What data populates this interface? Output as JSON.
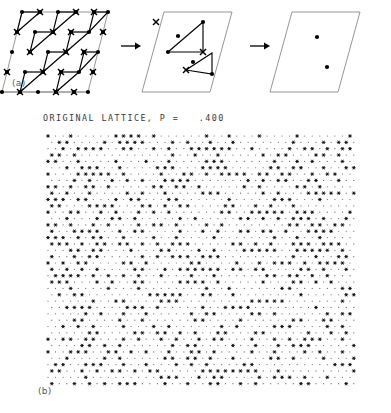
{
  "figure": {
    "labels": {
      "panel_a": "(a)",
      "panel_b": "(b)"
    },
    "panel_b_title": "ORIGINAL LATTICE, P =   .400",
    "colors": {
      "ink": "#000000",
      "cell_outline": "#8a8a8a",
      "grey_bond": "#8e8e8e",
      "background": "#ffffff",
      "label_grey": "#555555"
    }
  },
  "panel_a": {
    "caption": "(a)",
    "step_count": 3,
    "arrows": [
      {
        "name": "arrow-1",
        "x1": 121,
        "y1": 46,
        "x2": 141,
        "y2": 46
      },
      {
        "name": "arrow-2",
        "x1": 250,
        "y1": 46,
        "x2": 270,
        "y2": 46
      }
    ],
    "steps": [
      {
        "name": "original-supercell",
        "cell": [
          [
            22,
            12
          ],
          [
            108,
            12
          ],
          [
            88,
            92
          ],
          [
            2,
            92
          ]
        ],
        "dots": [
          [
            22,
            12
          ],
          [
            40,
            12
          ],
          [
            58,
            12
          ],
          [
            76,
            12
          ],
          [
            94,
            12
          ],
          [
            108,
            12
          ],
          [
            17,
            32
          ],
          [
            35,
            32
          ],
          [
            53,
            32
          ],
          [
            71,
            32
          ],
          [
            89,
            32
          ],
          [
            103,
            32
          ],
          [
            12,
            52
          ],
          [
            30,
            52
          ],
          [
            48,
            52
          ],
          [
            66,
            52
          ],
          [
            84,
            52
          ],
          [
            98,
            52
          ],
          [
            7,
            72
          ],
          [
            25,
            72
          ],
          [
            43,
            72
          ],
          [
            61,
            72
          ],
          [
            79,
            72
          ],
          [
            93,
            72
          ],
          [
            2,
            92
          ],
          [
            20,
            92
          ],
          [
            38,
            92
          ],
          [
            56,
            92
          ],
          [
            74,
            92
          ],
          [
            88,
            92
          ]
        ],
        "crosses": [
          [
            40,
            12
          ],
          [
            76,
            12
          ],
          [
            94,
            12
          ],
          [
            17,
            32
          ],
          [
            53,
            32
          ],
          [
            71,
            32
          ],
          [
            103,
            32
          ],
          [
            30,
            52
          ],
          [
            66,
            52
          ],
          [
            84,
            52
          ],
          [
            7,
            72
          ],
          [
            43,
            72
          ],
          [
            61,
            72
          ],
          [
            93,
            72
          ],
          [
            20,
            92
          ],
          [
            56,
            92
          ],
          [
            74,
            92
          ]
        ],
        "triangles": [
          [
            [
              22,
              12
            ],
            [
              40,
              12
            ],
            [
              17,
              32
            ]
          ],
          [
            [
              58,
              12
            ],
            [
              76,
              12
            ],
            [
              53,
              32
            ]
          ],
          [
            [
              94,
              12
            ],
            [
              108,
              12
            ],
            [
              89,
              32
            ]
          ],
          [
            [
              35,
              32
            ],
            [
              53,
              32
            ],
            [
              30,
              52
            ]
          ],
          [
            [
              71,
              32
            ],
            [
              89,
              32
            ],
            [
              66,
              52
            ]
          ],
          [
            [
              48,
              52
            ],
            [
              66,
              52
            ],
            [
              43,
              72
            ]
          ],
          [
            [
              84,
              52
            ],
            [
              98,
              52
            ],
            [
              79,
              72
            ]
          ],
          [
            [
              25,
              72
            ],
            [
              43,
              72
            ],
            [
              20,
              92
            ]
          ],
          [
            [
              61,
              72
            ],
            [
              79,
              72
            ],
            [
              56,
              92
            ]
          ]
        ],
        "grey_bonds": [
          [
            [
              22,
              12
            ],
            [
              40,
              12
            ]
          ],
          [
            [
              58,
              12
            ],
            [
              76,
              12
            ]
          ],
          [
            [
              94,
              12
            ],
            [
              108,
              12
            ]
          ],
          [
            [
              35,
              32
            ],
            [
              53,
              32
            ]
          ],
          [
            [
              71,
              32
            ],
            [
              89,
              32
            ]
          ],
          [
            [
              48,
              52
            ],
            [
              66,
              52
            ]
          ],
          [
            [
              84,
              52
            ],
            [
              98,
              52
            ]
          ],
          [
            [
              25,
              72
            ],
            [
              43,
              72
            ]
          ],
          [
            [
              61,
              72
            ],
            [
              79,
              72
            ]
          ],
          [
            [
              2,
              92
            ],
            [
              88,
              92
            ]
          ]
        ]
      },
      {
        "name": "intermediate-supercell",
        "cell": [
          [
            164,
            12
          ],
          [
            232,
            12
          ],
          [
            210,
            92
          ],
          [
            142,
            92
          ]
        ],
        "dots": [
          [
            178,
            36
          ],
          [
            203,
            22
          ],
          [
            168,
            52
          ],
          [
            193,
            62
          ],
          [
            212,
            74
          ]
        ],
        "crosses": [
          [
            156,
            22
          ],
          [
            203,
            52
          ],
          [
            186,
            70
          ]
        ],
        "triangles": [
          [
            [
              203,
              22
            ],
            [
              168,
              52
            ],
            [
              203,
              52
            ]
          ],
          [
            [
              212,
              53
            ],
            [
              186,
              70
            ],
            [
              212,
              74
            ]
          ]
        ],
        "isolated_dots": [
          [
            168,
            52
          ],
          [
            178,
            36
          ]
        ]
      },
      {
        "name": "final-supercell",
        "cell": [
          [
            292,
            12
          ],
          [
            360,
            12
          ],
          [
            338,
            92
          ],
          [
            270,
            92
          ]
        ],
        "dots": [
          [
            317,
            37
          ],
          [
            327,
            67
          ]
        ],
        "crosses": [],
        "triangles": []
      }
    ]
  },
  "panel_b": {
    "caption": "(b)",
    "title": "ORIGINAL LATTICE, P =   .400",
    "probability": 0.4,
    "lattice": {
      "type": "triangular",
      "x_start": 48,
      "y_start": 136,
      "dx": 7.55,
      "dy": 6.35,
      "cols": 41,
      "rows": 40,
      "row_offset": 3.775,
      "occupied_symbol": "star",
      "empty_symbol": "dot",
      "occupied_fraction": 0.4,
      "seed": 20250412
    }
  }
}
